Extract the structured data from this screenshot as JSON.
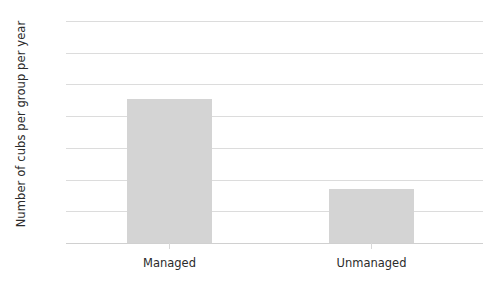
{
  "chart_data": {
    "type": "bar",
    "title": "",
    "xlabel": "",
    "ylabel": "Number of cubs per group per year",
    "categories": [
      "Managed",
      "Unmanaged"
    ],
    "values": [
      2.27,
      0.85
    ],
    "ylim": [
      0,
      3.5
    ],
    "ytick_values": [
      0,
      0.5,
      1.0,
      1.5,
      2.0,
      2.5,
      3.0,
      3.5
    ],
    "ytick_labels": [
      "0",
      "0,5",
      "1,0",
      "1,5",
      "2,0",
      "2,5",
      "3,0",
      "3,5"
    ],
    "decimal_separator": ",",
    "grid": true,
    "legend": false,
    "bar_color": "#d4d4d4",
    "gridline_color": "#dcdcdc",
    "text_color": "#2b2b2b",
    "background_color": "#ffffff"
  }
}
